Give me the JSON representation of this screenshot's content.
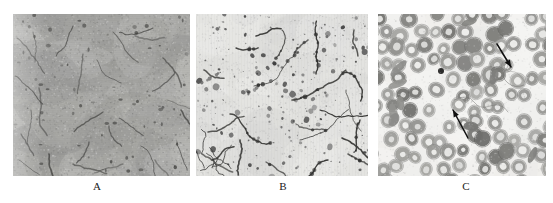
{
  "figure": {
    "background_color": "#ffffff",
    "width": 553,
    "height": 203,
    "panel_count": 3
  },
  "panels": [
    {
      "id": "panel-a",
      "label": "A",
      "label_x": 97,
      "label_y": 180,
      "x": 13,
      "y": 14,
      "width": 177,
      "height": 162,
      "background_color": "#a9a9a6",
      "feature_color": "#4a4a48",
      "description": "electron micrograph, dark gray grainy field with curved filaments"
    },
    {
      "id": "panel-b",
      "label": "B",
      "label_x": 283,
      "label_y": 180,
      "x": 196,
      "y": 14,
      "width": 172,
      "height": 162,
      "background_color": "#e3e3e0",
      "feature_color": "#3a3a38",
      "description": "electron micrograph, pale field with dark filaments and speckles"
    },
    {
      "id": "panel-c",
      "label": "C",
      "label_x": 466,
      "label_y": 180,
      "x": 378,
      "y": 14,
      "width": 168,
      "height": 162,
      "background_color": "#f0efec",
      "feature_color": "#8a8a88",
      "description": "blood smear, ring-shaped red blood cells with two black arrows",
      "annotations": [
        {
          "name": "arrow-upper-right",
          "direction": "down-right"
        },
        {
          "name": "arrow-lower-middle",
          "direction": "up-left"
        }
      ]
    }
  ]
}
